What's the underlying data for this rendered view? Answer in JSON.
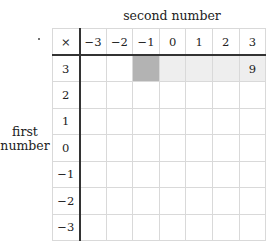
{
  "titles": {
    "top": "second number",
    "left_line1": "first",
    "left_line2": "number"
  },
  "grid": {
    "corner": "×",
    "columns": [
      "−3",
      "−2",
      "−1",
      "0",
      "1",
      "2",
      "3"
    ],
    "rows": [
      {
        "label": "3",
        "cells": [
          "",
          "",
          "",
          "",
          "",
          "",
          "9"
        ],
        "shading": [
          "none",
          "none",
          "dark",
          "light",
          "light",
          "light",
          "light"
        ]
      },
      {
        "label": "2",
        "cells": [
          "",
          "",
          "",
          "",
          "",
          "",
          ""
        ]
      },
      {
        "label": "1",
        "cells": [
          "",
          "",
          "",
          "",
          "",
          "",
          ""
        ]
      },
      {
        "label": "0",
        "cells": [
          "",
          "",
          "",
          "",
          "",
          "",
          ""
        ]
      },
      {
        "label": "−1",
        "cells": [
          "",
          "",
          "",
          "",
          "",
          "",
          ""
        ]
      },
      {
        "label": "−2",
        "cells": [
          "",
          "",
          "",
          "",
          "",
          "",
          ""
        ]
      },
      {
        "label": "−3",
        "cells": [
          "",
          "",
          "",
          "",
          "",
          "",
          ""
        ]
      }
    ]
  },
  "colors": {
    "dark_shade": "#b3b3b3",
    "light_shade": "#eeeeee",
    "axis_line": "#333333",
    "grid_line": "#d9d9d9"
  }
}
